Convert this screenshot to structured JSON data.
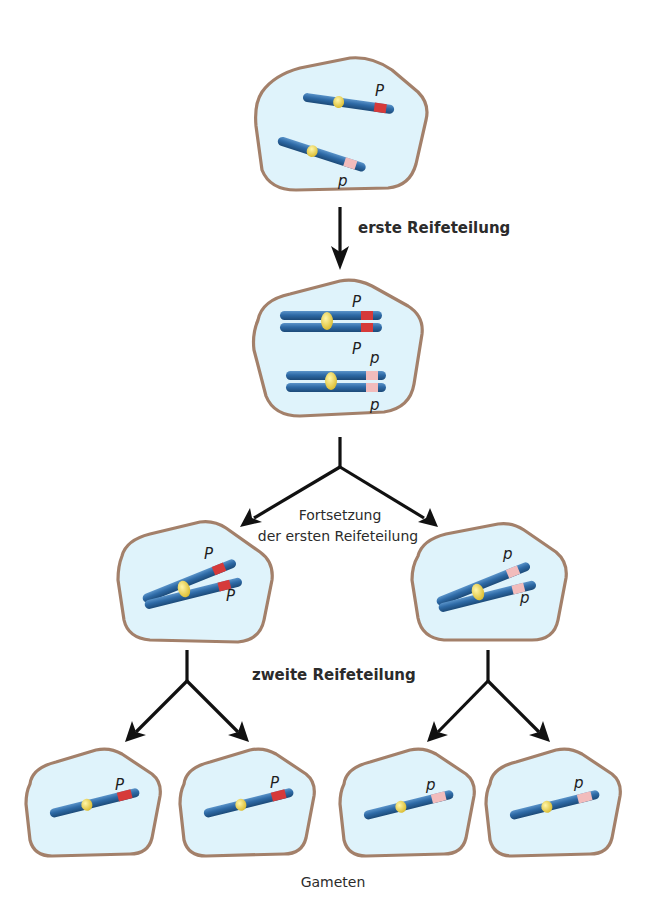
{
  "colors": {
    "cell_fill": "#dff3fb",
    "cell_border": "#a3806a",
    "chromosome": "#2e6aa6",
    "chromosome_dark": "#1f4f80",
    "centromere": "#e9d24a",
    "allele_dominant": "#d63a3a",
    "allele_recessive": "#f2bcbc",
    "arrow": "#111111"
  },
  "labels": {
    "step1": "erste Reifeteilung",
    "step2_line1": "Fortsetzung",
    "step2_line2": "der ersten Reifeteilung",
    "step3": "zweite Reifeteilung",
    "result": "Gameten"
  },
  "cells": {
    "top": {
      "alleles": [
        "P",
        "p"
      ]
    },
    "middle": {
      "alleles": [
        "P",
        "P",
        "p",
        "p"
      ]
    },
    "left": {
      "alleles": [
        "P",
        "P"
      ]
    },
    "right": {
      "alleles": [
        "p",
        "p"
      ]
    },
    "gamete1": {
      "allele": "P"
    },
    "gamete2": {
      "allele": "P"
    },
    "gamete3": {
      "allele": "p"
    },
    "gamete4": {
      "allele": "p"
    }
  }
}
